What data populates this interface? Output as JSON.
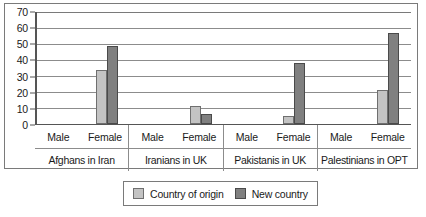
{
  "chart_data": {
    "type": "bar",
    "title": "",
    "subtitle": "",
    "xlabel": "",
    "ylabel": "",
    "ylim": [
      0,
      70
    ],
    "ytick_step": 10,
    "yticks": [
      70,
      60,
      50,
      40,
      30,
      20,
      10,
      0
    ],
    "grid": true,
    "legend_position": "bottom-center",
    "group_labels": [
      "Afghans in Iran",
      "Iranians in UK",
      "Pakistanis in UK",
      "Palestinians in OPT"
    ],
    "sub_categories": [
      "Male",
      "Female"
    ],
    "categories": [
      "Afghans in Iran - Male",
      "Afghans in Iran - Female",
      "Iranians in UK - Male",
      "Iranians in UK - Female",
      "Pakistanis in UK - Male",
      "Pakistanis in UK - Female",
      "Palestinians in OPT - Male",
      "Palestinians in OPT - Female"
    ],
    "series": [
      {
        "name": "Country of origin",
        "color": "#c3c3c3",
        "values": [
          0,
          34,
          0,
          11,
          0,
          5,
          0,
          21
        ]
      },
      {
        "name": "New country",
        "color": "#808080",
        "values": [
          0,
          49,
          0,
          6,
          0,
          38,
          0,
          57
        ]
      }
    ]
  },
  "legend": {
    "items": [
      {
        "label": "Country of origin",
        "swatch": "origin"
      },
      {
        "label": "New country",
        "swatch": "newc"
      }
    ]
  },
  "colors": {
    "origin": "#c3c3c3",
    "new_country": "#808080",
    "gridline": "#8c8c8c",
    "axis": "#555555",
    "frame": "#7a7a7a",
    "background": "#ffffff"
  }
}
